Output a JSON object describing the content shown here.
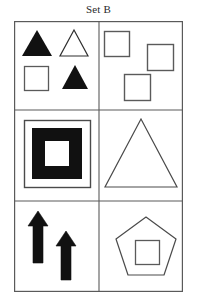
{
  "title": "Set B",
  "colors": {
    "stroke": "#5a5a5a",
    "fill_dark": "#111111",
    "background": "#ffffff",
    "title_text": "#2b2b2b"
  },
  "grid": {
    "rows": 3,
    "columns": 2,
    "left": 14,
    "top": 21,
    "width": 169,
    "height": 271,
    "column_divider_x": 85,
    "row_divider_y": [
      89,
      180
    ]
  },
  "cells": [
    {
      "position": "row1-col1",
      "name": "top-left-cell",
      "description": "Four small shapes in a 2x2 arrangement",
      "shapes": [
        {
          "kind": "triangle",
          "fill": "solid",
          "label": "filled-triangle",
          "x": 22,
          "y": 30,
          "w": 30,
          "h": 26
        },
        {
          "kind": "triangle",
          "fill": "outline",
          "label": "outline-triangle",
          "x": 60,
          "y": 30,
          "w": 28,
          "h": 26
        },
        {
          "kind": "square",
          "fill": "outline",
          "label": "outline-square",
          "x": 24,
          "y": 66,
          "w": 24,
          "h": 24
        },
        {
          "kind": "triangle",
          "fill": "solid",
          "label": "filled-triangle",
          "x": 62,
          "y": 64,
          "w": 26,
          "h": 24
        }
      ]
    },
    {
      "position": "row1-col2",
      "name": "top-right-cell",
      "description": "Three outline squares staggered",
      "shapes": [
        {
          "kind": "square",
          "fill": "outline",
          "label": "outline-square",
          "x": 104,
          "y": 31,
          "w": 25,
          "h": 25
        },
        {
          "kind": "square",
          "fill": "outline",
          "label": "outline-square",
          "x": 147,
          "y": 44,
          "w": 26,
          "h": 26
        },
        {
          "kind": "square",
          "fill": "outline",
          "label": "outline-square",
          "x": 124,
          "y": 74,
          "w": 26,
          "h": 26
        }
      ]
    },
    {
      "position": "row2-col1",
      "name": "middle-left-cell",
      "description": "Thick black square ring inside a thin outline square",
      "shapes": [
        {
          "kind": "square",
          "fill": "outline",
          "label": "outer-outline-square",
          "x": 24,
          "y": 120,
          "w": 66,
          "h": 67
        },
        {
          "kind": "square-ring",
          "fill": "solid",
          "label": "thick-black-square-ring",
          "x": 32,
          "y": 128,
          "w": 50,
          "h": 51,
          "hole_w": 24,
          "hole_h": 25
        }
      ]
    },
    {
      "position": "row2-col2",
      "name": "middle-right-cell",
      "description": "Single large outline triangle",
      "shapes": [
        {
          "kind": "triangle",
          "fill": "outline",
          "label": "large-outline-triangle",
          "x": 105,
          "y": 119,
          "w": 72,
          "h": 68
        }
      ]
    },
    {
      "position": "row3-col1",
      "name": "bottom-left-cell",
      "description": "Two solid black upward arrows of different sizes",
      "shapes": [
        {
          "kind": "arrow-up",
          "fill": "solid",
          "label": "tall-filled-arrow-up",
          "x": 28,
          "y": 211,
          "w": 20,
          "h": 52
        },
        {
          "kind": "arrow-up",
          "fill": "solid",
          "label": "short-filled-arrow-up",
          "x": 56,
          "y": 231,
          "w": 20,
          "h": 49
        }
      ]
    },
    {
      "position": "row3-col2",
      "name": "bottom-right-cell",
      "description": "Outline pentagon containing a small outline square",
      "shapes": [
        {
          "kind": "pentagon",
          "fill": "outline",
          "label": "outline-pentagon",
          "x": 116,
          "y": 217,
          "w": 60,
          "h": 58
        },
        {
          "kind": "square",
          "fill": "outline",
          "label": "inner-outline-square",
          "x": 135,
          "y": 240,
          "w": 24,
          "h": 24
        }
      ]
    }
  ]
}
